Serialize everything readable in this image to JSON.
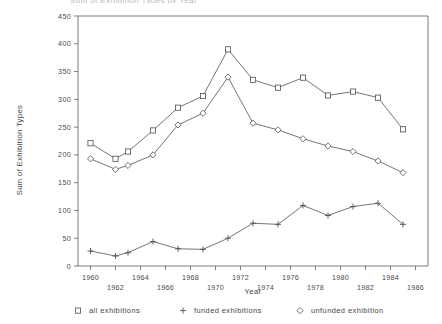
{
  "chart_data": {
    "type": "line",
    "title": "Sum of Exhibition Types by Year",
    "xlabel": "Year",
    "ylabel": "Sum of Exhibition Types",
    "x": [
      1960,
      1961,
      1962,
      1963,
      1964,
      1965,
      1966,
      1967,
      1968,
      1969,
      1970,
      1971,
      1972,
      1973,
      1974,
      1975,
      1976,
      1977,
      1978,
      1979,
      1980,
      1981,
      1982,
      1983,
      1984,
      1985,
      1986
    ],
    "xtick_labels": [
      "1960",
      "1962",
      "1964",
      "1966",
      "1968",
      "1970",
      "1972",
      "1974",
      "1976",
      "1978",
      "1980",
      "1982",
      "1984",
      "1986"
    ],
    "xtick_values": [
      1960,
      1962,
      1964,
      1966,
      1968,
      1970,
      1972,
      1974,
      1976,
      1978,
      1980,
      1982,
      1984,
      1986
    ],
    "ytick_labels": [
      "0",
      "50",
      "100",
      "150",
      "200",
      "250",
      "300",
      "350",
      "400",
      "450"
    ],
    "ytick_values": [
      0,
      50,
      100,
      150,
      200,
      250,
      300,
      350,
      400,
      450
    ],
    "xlim": [
      1959,
      1987
    ],
    "ylim": [
      0,
      450
    ],
    "grid": false,
    "legend_position": "bottom",
    "series": [
      {
        "name": "all exhibitions",
        "marker": "square",
        "values": [
          221,
          null,
          193,
          206,
          null,
          244,
          null,
          285,
          null,
          306,
          null,
          390,
          null,
          335,
          null,
          321,
          null,
          339,
          null,
          307,
          null,
          314,
          null,
          303,
          null,
          246,
          null
        ],
        "points": [
          {
            "x": 1960,
            "y": 221
          },
          {
            "x": 1962,
            "y": 193
          },
          {
            "x": 1963,
            "y": 206
          },
          {
            "x": 1965,
            "y": 244
          },
          {
            "x": 1967,
            "y": 285
          },
          {
            "x": 1969,
            "y": 306
          },
          {
            "x": 1971,
            "y": 390
          },
          {
            "x": 1973,
            "y": 335
          },
          {
            "x": 1975,
            "y": 321
          },
          {
            "x": 1977,
            "y": 339
          },
          {
            "x": 1979,
            "y": 307
          },
          {
            "x": 1981,
            "y": 314
          },
          {
            "x": 1983,
            "y": 303
          },
          {
            "x": 1985,
            "y": 246
          }
        ]
      },
      {
        "name": "funded exhibitions",
        "marker": "plus",
        "points": [
          {
            "x": 1960,
            "y": 27
          },
          {
            "x": 1962,
            "y": 18
          },
          {
            "x": 1963,
            "y": 24
          },
          {
            "x": 1965,
            "y": 44
          },
          {
            "x": 1967,
            "y": 31
          },
          {
            "x": 1969,
            "y": 30
          },
          {
            "x": 1971,
            "y": 50
          },
          {
            "x": 1973,
            "y": 77
          },
          {
            "x": 1975,
            "y": 75
          },
          {
            "x": 1977,
            "y": 109
          },
          {
            "x": 1979,
            "y": 91
          },
          {
            "x": 1981,
            "y": 107
          },
          {
            "x": 1983,
            "y": 113
          },
          {
            "x": 1985,
            "y": 75
          }
        ]
      },
      {
        "name": "unfunded exhibition",
        "marker": "diamond",
        "points": [
          {
            "x": 1960,
            "y": 193
          },
          {
            "x": 1962,
            "y": 174
          },
          {
            "x": 1963,
            "y": 181
          },
          {
            "x": 1965,
            "y": 200
          },
          {
            "x": 1967,
            "y": 254
          },
          {
            "x": 1969,
            "y": 275
          },
          {
            "x": 1971,
            "y": 340
          },
          {
            "x": 1973,
            "y": 257
          },
          {
            "x": 1975,
            "y": 245
          },
          {
            "x": 1977,
            "y": 229
          },
          {
            "x": 1979,
            "y": 216
          },
          {
            "x": 1981,
            "y": 206
          },
          {
            "x": 1983,
            "y": 189
          },
          {
            "x": 1985,
            "y": 168
          }
        ]
      }
    ]
  },
  "legend": {
    "items": [
      {
        "label": "all exhibitions",
        "marker": "square"
      },
      {
        "label": "funded exhibitions",
        "marker": "plus"
      },
      {
        "label": "unfunded exhibition",
        "marker": "diamond"
      }
    ]
  },
  "axes": {
    "x_title": "Year",
    "y_title": "Sum of Exhibition Types"
  }
}
